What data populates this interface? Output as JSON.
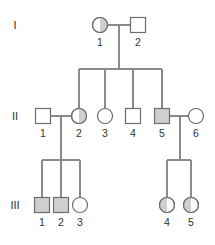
{
  "diagram": {
    "type": "pedigree",
    "colors": {
      "line": "#8a8a8a",
      "outline": "#6d6d6d",
      "affected_fill": "#cfcfcf",
      "unaffected_fill": "#ffffff"
    },
    "generations": [
      {
        "label": "I",
        "y": 25
      },
      {
        "label": "II",
        "y": 116
      },
      {
        "label": "III",
        "y": 205
      }
    ],
    "individuals": [
      {
        "id": "I-1",
        "gen": "I",
        "num": "1",
        "sex": "female",
        "status": "carrier-right-half",
        "cx": 100,
        "cy": 25
      },
      {
        "id": "I-2",
        "gen": "I",
        "num": "2",
        "sex": "male",
        "status": "unaffected",
        "cx": 138,
        "cy": 25
      },
      {
        "id": "II-1",
        "gen": "II",
        "num": "1",
        "sex": "male",
        "status": "unaffected",
        "cx": 43,
        "cy": 116
      },
      {
        "id": "II-2",
        "gen": "II",
        "num": "2",
        "sex": "female",
        "status": "carrier-right-half",
        "cx": 79,
        "cy": 116
      },
      {
        "id": "II-3",
        "gen": "II",
        "num": "3",
        "sex": "female",
        "status": "unaffected",
        "cx": 105,
        "cy": 116
      },
      {
        "id": "II-4",
        "gen": "II",
        "num": "4",
        "sex": "male",
        "status": "unaffected",
        "cx": 133,
        "cy": 116
      },
      {
        "id": "II-5",
        "gen": "II",
        "num": "5",
        "sex": "male",
        "status": "affected",
        "cx": 162,
        "cy": 116
      },
      {
        "id": "II-6",
        "gen": "II",
        "num": "6",
        "sex": "female",
        "status": "unaffected",
        "cx": 196,
        "cy": 116
      },
      {
        "id": "III-1",
        "gen": "III",
        "num": "1",
        "sex": "male",
        "status": "affected",
        "cx": 42,
        "cy": 205
      },
      {
        "id": "III-2",
        "gen": "III",
        "num": "2",
        "sex": "male",
        "status": "affected",
        "cx": 61,
        "cy": 205
      },
      {
        "id": "III-3",
        "gen": "III",
        "num": "3",
        "sex": "female",
        "status": "unaffected",
        "cx": 80,
        "cy": 205
      },
      {
        "id": "III-4",
        "gen": "III",
        "num": "4",
        "sex": "female",
        "status": "carrier-left-half",
        "cx": 167,
        "cy": 205
      },
      {
        "id": "III-5",
        "gen": "III",
        "num": "5",
        "sex": "female",
        "status": "carrier-left-half",
        "cx": 191,
        "cy": 205
      }
    ],
    "matings": [
      {
        "partners": [
          "I-1",
          "I-2"
        ],
        "children": [
          "II-2",
          "II-3",
          "II-4",
          "II-5"
        ]
      },
      {
        "partners": [
          "II-1",
          "II-2"
        ],
        "children": [
          "III-1",
          "III-2",
          "III-3"
        ]
      },
      {
        "partners": [
          "II-5",
          "II-6"
        ],
        "children": [
          "III-4",
          "III-5"
        ]
      }
    ]
  }
}
